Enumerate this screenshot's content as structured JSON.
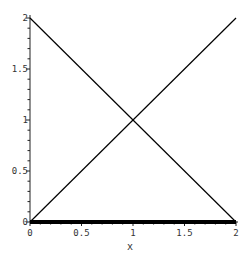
{
  "chart_data": {
    "type": "line",
    "title": "",
    "xlabel": "x",
    "ylabel": "",
    "xlim": [
      0,
      2
    ],
    "ylim": [
      0,
      2
    ],
    "grid": false,
    "legend": null,
    "x_ticks": [
      0,
      0.5,
      1,
      1.5,
      2
    ],
    "x_tick_labels": [
      "0",
      "0.5",
      "1",
      "1.5",
      "2"
    ],
    "y_ticks": [
      0,
      0.5,
      1,
      1.5,
      2
    ],
    "y_tick_labels": [
      "0",
      "0.5",
      "1",
      "1.5",
      "2"
    ],
    "series": [
      {
        "name": "y = x",
        "x": [
          0,
          2
        ],
        "y": [
          0,
          2
        ],
        "color": "#000000",
        "width": 1.2
      },
      {
        "name": "y = 2 - x",
        "x": [
          0,
          2
        ],
        "y": [
          2,
          0
        ],
        "color": "#000000",
        "width": 1.2
      },
      {
        "name": "y = 0",
        "x": [
          0,
          2
        ],
        "y": [
          0,
          0
        ],
        "color": "#000000",
        "width": 4
      }
    ]
  },
  "layout": {
    "plot_left": 30,
    "plot_right": 236,
    "plot_top": 18,
    "plot_bottom": 222
  }
}
